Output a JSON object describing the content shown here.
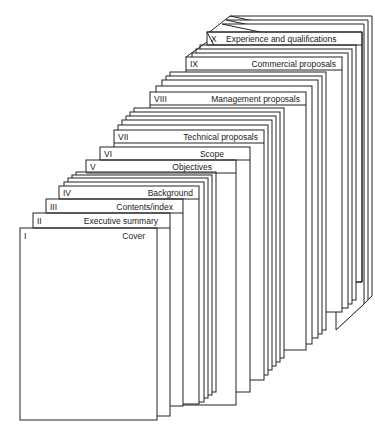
{
  "diagram": {
    "type": "stacked-document-sections",
    "sections": [
      {
        "numeral": "I",
        "title": "Cover"
      },
      {
        "numeral": "II",
        "title": "Executive summary"
      },
      {
        "numeral": "III",
        "title": "Contents/index"
      },
      {
        "numeral": "IV",
        "title": "Background"
      },
      {
        "numeral": "V",
        "title": "Objectives"
      },
      {
        "numeral": "VI",
        "title": "Scope"
      },
      {
        "numeral": "VII",
        "title": "Technical proposals"
      },
      {
        "numeral": "VIII",
        "title": "Management proposals"
      },
      {
        "numeral": "IX",
        "title": "Commercial proposals"
      },
      {
        "numeral": "X",
        "title": "Experience and qualifications"
      }
    ],
    "stroke_color": "#222222",
    "background_color": "#ffffff"
  }
}
